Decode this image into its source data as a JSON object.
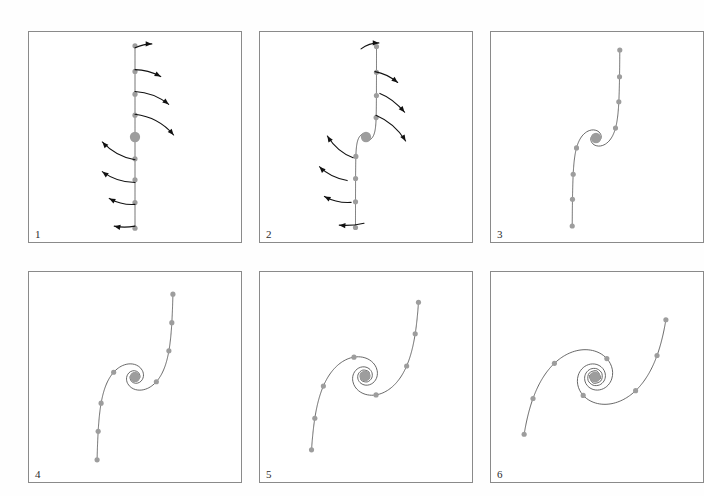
{
  "figure": {
    "background_color": "#ffffff",
    "panel_border_color": "#8a8a8a",
    "curve_color": "#555555",
    "knot_color": "#9d9d9d",
    "arrow_color": "#111111",
    "panel_count": 6,
    "columns": 3,
    "rows": 2
  },
  "panels": [
    {
      "label": "1",
      "x": 28,
      "y": 31,
      "w": 214,
      "h": 212,
      "description": "straight vertical line of tracer dots with curved velocity arrows",
      "stage": 0.0,
      "has_arrows": true,
      "center": {
        "cx": 107,
        "cy": 106
      },
      "center_radius": 5.2,
      "knot_radius": 2.6,
      "curve_points": [
        [
          107,
          16
        ],
        [
          107,
          38
        ],
        [
          107,
          60
        ],
        [
          107,
          83
        ],
        [
          107,
          106
        ],
        [
          107,
          129
        ],
        [
          107,
          152
        ],
        [
          107,
          174
        ],
        [
          107,
          196
        ]
      ],
      "arrows": [
        {
          "from": [
            107,
            16
          ],
          "ctrl": [
            116,
            12
          ],
          "to": [
            124,
            12
          ],
          "bow": 4
        },
        {
          "from": [
            107,
            38
          ],
          "ctrl": [
            120,
            38
          ],
          "to": [
            133,
            45
          ],
          "bow": 6
        },
        {
          "from": [
            107,
            60
          ],
          "ctrl": [
            126,
            61
          ],
          "to": [
            141,
            73
          ],
          "bow": 8
        },
        {
          "from": [
            107,
            83
          ],
          "ctrl": [
            131,
            86
          ],
          "to": [
            146,
            104
          ],
          "bow": 10
        },
        {
          "from": [
            107,
            129
          ],
          "ctrl": [
            88,
            126
          ],
          "to": [
            74,
            111
          ],
          "bow": 10
        },
        {
          "from": [
            107,
            152
          ],
          "ctrl": [
            89,
            152
          ],
          "to": [
            74,
            141
          ],
          "bow": 8
        },
        {
          "from": [
            107,
            174
          ],
          "ctrl": [
            94,
            175
          ],
          "to": [
            81,
            168
          ],
          "bow": 6
        },
        {
          "from": [
            107,
            196
          ],
          "ctrl": [
            96,
            198
          ],
          "to": [
            86,
            196
          ],
          "bow": 4
        }
      ]
    },
    {
      "label": "2",
      "x": 259,
      "y": 31,
      "w": 214,
      "h": 212,
      "description": "line beginning to shear into an S shape, velocity arrows still shown",
      "stage": 0.35,
      "has_arrows": true,
      "center": {
        "cx": 107,
        "cy": 106
      },
      "center_radius": 5.2,
      "knot_radius": 2.6,
      "curve_points": [
        [
          102,
          17
        ],
        [
          116,
          40
        ],
        [
          121,
          62
        ],
        [
          117,
          84
        ],
        [
          107,
          106
        ],
        [
          94,
          127
        ],
        [
          88,
          150
        ],
        [
          92,
          172
        ],
        [
          105,
          193
        ]
      ],
      "arrows": [
        {
          "from": [
            102,
            17
          ],
          "ctrl": [
            110,
            11
          ],
          "to": [
            120,
            11
          ],
          "bow": 4
        },
        {
          "from": [
            116,
            40
          ],
          "ctrl": [
            128,
            42
          ],
          "to": [
            139,
            51
          ],
          "bow": 6
        },
        {
          "from": [
            121,
            62
          ],
          "ctrl": [
            134,
            67
          ],
          "to": [
            146,
            81
          ],
          "bow": 8
        },
        {
          "from": [
            117,
            84
          ],
          "ctrl": [
            136,
            92
          ],
          "to": [
            147,
            110
          ],
          "bow": 10
        },
        {
          "from": [
            94,
            127
          ],
          "ctrl": [
            78,
            121
          ],
          "to": [
            68,
            105
          ],
          "bow": 10
        },
        {
          "from": [
            88,
            150
          ],
          "ctrl": [
            71,
            147
          ],
          "to": [
            60,
            136
          ],
          "bow": 8
        },
        {
          "from": [
            92,
            172
          ],
          "ctrl": [
            78,
            173
          ],
          "to": [
            65,
            166
          ],
          "bow": 6
        },
        {
          "from": [
            105,
            193
          ],
          "ctrl": [
            92,
            196
          ],
          "to": [
            80,
            195
          ],
          "bow": 4
        }
      ]
    },
    {
      "label": "3",
      "x": 490,
      "y": 31,
      "w": 214,
      "h": 212,
      "description": "open S-curve, no arrows",
      "stage": 0.8,
      "has_arrows": false,
      "center": {
        "cx": 106,
        "cy": 107
      },
      "center_radius": 5.2,
      "knot_radius": 2.6,
      "curve_points": [
        [
          105,
          22
        ],
        [
          140,
          38
        ],
        [
          158,
          73
        ],
        [
          149,
          104
        ],
        [
          106,
          107
        ],
        [
          61,
          110
        ],
        [
          46,
          141
        ],
        [
          62,
          176
        ],
        [
          96,
          192
        ]
      ]
    },
    {
      "label": "4",
      "x": 28,
      "y": 271,
      "w": 214,
      "h": 212,
      "description": "S-curve wound further, rotated",
      "stage": 1.3,
      "has_arrows": false,
      "center": {
        "cx": 107,
        "cy": 106
      },
      "center_radius": 5.2,
      "knot_radius": 2.6,
      "curve_points": [
        [
          156,
          21
        ],
        [
          175,
          61
        ],
        [
          165,
          98
        ],
        [
          132,
          120
        ],
        [
          107,
          106
        ],
        [
          78,
          82
        ],
        [
          46,
          82
        ],
        [
          27,
          116
        ],
        [
          35,
          163
        ]
      ]
    },
    {
      "label": "5",
      "x": 259,
      "y": 271,
      "w": 214,
      "h": 212,
      "description": "nearly one full turn, long trailing arms",
      "stage": 1.9,
      "has_arrows": false,
      "center": {
        "cx": 106,
        "cy": 105
      },
      "center_radius": 5.5,
      "knot_radius": 2.6,
      "curve_points": [
        [
          168,
          26
        ],
        [
          180,
          70
        ],
        [
          167,
          110
        ],
        [
          132,
          121
        ],
        [
          106,
          105
        ],
        [
          78,
          90
        ],
        [
          44,
          102
        ],
        [
          34,
          144
        ],
        [
          44,
          185
        ]
      ]
    },
    {
      "label": "6",
      "x": 490,
      "y": 271,
      "w": 214,
      "h": 212,
      "description": "fully developed two-armed spiral",
      "stage": 2.7,
      "has_arrows": false,
      "center": {
        "cx": 105,
        "cy": 106
      },
      "center_radius": 5.5,
      "knot_radius": 2.6,
      "curve_points": [
        [
          148,
          53
        ],
        [
          178,
          89
        ],
        [
          168,
          129
        ],
        [
          131,
          134
        ],
        [
          105,
          106
        ],
        [
          79,
          78
        ],
        [
          42,
          84
        ],
        [
          32,
          126
        ],
        [
          62,
          164
        ]
      ]
    }
  ]
}
